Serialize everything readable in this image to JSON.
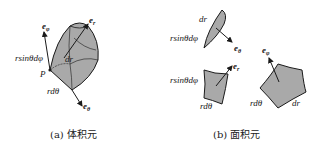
{
  "colors": {
    "fill": "#a9a9a9",
    "stroke": "#1a1a1a",
    "background": "#ffffff"
  },
  "panel_a": {
    "caption": "(a) 体积元",
    "labels": {
      "e_phi": "e",
      "e_phi_sub": "φ",
      "e_r": "e",
      "e_r_sub": "r",
      "e_theta": "e",
      "e_theta_sub": "θ",
      "rsin": "rsinθdφ",
      "dr": "dr",
      "P": "P",
      "rdtheta": "rdθ"
    }
  },
  "panel_b": {
    "caption": "(b) 面积元",
    "surface_theta": {
      "dr": "dr",
      "rsin": "rsinθdφ",
      "vec": "e",
      "vec_sub": "θ"
    },
    "surface_r": {
      "rsin": "rsinθdφ",
      "rdtheta": "rdθ",
      "vec": "e",
      "vec_sub": "r"
    },
    "surface_phi": {
      "rdtheta": "rdθ",
      "dr": "dr",
      "vec": "e",
      "vec_sub": "φ"
    }
  }
}
